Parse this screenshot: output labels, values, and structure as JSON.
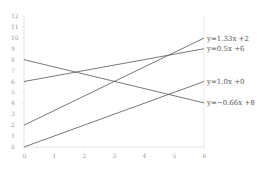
{
  "chart_data": {
    "type": "line",
    "title": "",
    "xlabel": "",
    "ylabel": "",
    "xlim": [
      0,
      6
    ],
    "ylim": [
      0,
      12
    ],
    "x_ticks": [
      "0",
      "1",
      "2",
      "3",
      "4",
      "5",
      "6"
    ],
    "y_ticks": [
      "0",
      "1",
      "2",
      "3",
      "4",
      "5",
      "6",
      "7",
      "8",
      "9",
      "10",
      "11",
      "12"
    ],
    "grid": false,
    "legend_position": "inline-right",
    "series": [
      {
        "name": "y=1.33x+2",
        "label": "y=1.33x +2",
        "x": [
          0,
          6
        ],
        "values": [
          2,
          9.98
        ],
        "color": "#555555"
      },
      {
        "name": "y=0.5x+6",
        "label": "y=0.5x +6",
        "x": [
          0,
          6
        ],
        "values": [
          6,
          9
        ],
        "color": "#555555"
      },
      {
        "name": "y=1.0x+0",
        "label": "y=1.0x +0",
        "x": [
          0,
          6
        ],
        "values": [
          0,
          6
        ],
        "color": "#555555"
      },
      {
        "name": "y=-0.66x+8",
        "label": "y=−0.66x +8",
        "x": [
          0,
          6
        ],
        "values": [
          8,
          4.04
        ],
        "color": "#555555"
      }
    ]
  },
  "colors": {
    "axis": "#dddddd",
    "tick_text": "#999999",
    "line": "#555555",
    "label_text": "#555555"
  }
}
